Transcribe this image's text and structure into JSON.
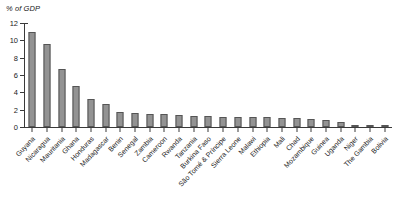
{
  "chart_data": {
    "type": "bar",
    "title": "",
    "subtitle": "",
    "xlabel": "",
    "ylabel": "% of GDP",
    "unit_label": "% of GDP",
    "ylim": [
      0,
      12
    ],
    "yticks": [
      0,
      2,
      4,
      6,
      8,
      10,
      12
    ],
    "ytick_labels": [
      "0",
      "2",
      "4",
      "6",
      "8",
      "10",
      "12"
    ],
    "grid": false,
    "legend": null,
    "legend_position": "none",
    "bar_color": "#939393",
    "bar_edge_color": "#555555",
    "axis_color": "#3a3a3a",
    "categories": [
      "Guyana",
      "Nicaragua",
      "Mauritania",
      "Ghana",
      "Honduras",
      "Madagascar",
      "Benin",
      "Senegal",
      "Zambia",
      "Cameroon",
      "Rwanda",
      "Tanzania",
      "Burkina Faso",
      "São Tomé & Príncipe",
      "Sierra Leone",
      "Malawi",
      "Ethiopia",
      "Mali",
      "Chad",
      "Mozambique",
      "Guinea",
      "Uganda",
      "Niger",
      "The Gambia",
      "Bolivia"
    ],
    "values": [
      11.0,
      9.6,
      6.7,
      4.7,
      3.2,
      2.6,
      1.7,
      1.6,
      1.5,
      1.5,
      1.4,
      1.3,
      1.3,
      1.2,
      1.2,
      1.1,
      1.1,
      1.0,
      1.0,
      0.9,
      0.8,
      0.6,
      0.2,
      0.1,
      0.1
    ]
  }
}
